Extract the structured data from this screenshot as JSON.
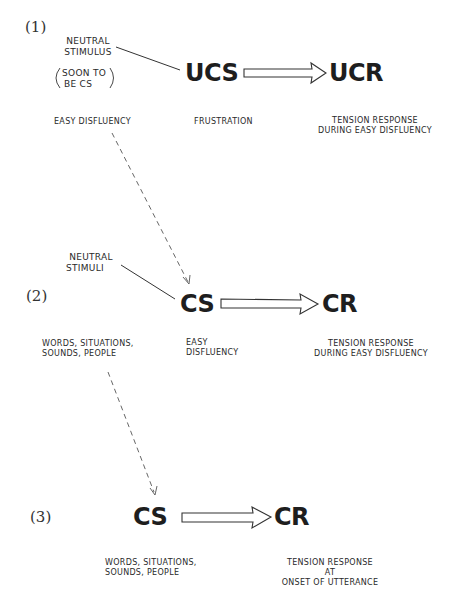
{
  "diagram": {
    "type": "classical-conditioning-stages",
    "stages": [
      {
        "number_label": "(1)",
        "stimulus_label": "UCS",
        "response_label": "UCR",
        "neutral_label_lines": [
          "NEUTRAL",
          "STIMULUS"
        ],
        "neutral_note_lines": [
          "SOON TO",
          "BE CS"
        ],
        "left_caption": "EASY DISFLUENCY",
        "stimulus_caption": "FRUSTRATION",
        "response_caption_lines": [
          "TENSION RESPONSE",
          "DURING EASY DISFLUENCY"
        ]
      },
      {
        "number_label": "(2)",
        "stimulus_label": "CS",
        "response_label": "CR",
        "neutral_label_lines": [
          "NEUTRAL",
          "STIMULI"
        ],
        "left_caption_lines": [
          "WORDS, SITUATIONS,",
          "SOUNDS, PEOPLE"
        ],
        "stimulus_caption_lines": [
          "EASY",
          "DISFLUENCY"
        ],
        "response_caption_lines": [
          "TENSION RESPONSE",
          "DURING EASY DISFLUENCY"
        ]
      },
      {
        "number_label": "(3)",
        "stimulus_label": "CS",
        "response_label": "CR",
        "stimulus_caption_lines": [
          "WORDS, SITUATIONS,",
          "SOUNDS, PEOPLE"
        ],
        "response_caption_lines": [
          "TENSION RESPONSE",
          "AT",
          "ONSET OF UTTERANCE"
        ]
      }
    ],
    "edges": [
      {
        "from": "stage1.neutral_stimulus",
        "to": "stage1.UCS",
        "style": "solid-line"
      },
      {
        "from": "stage1.UCS",
        "to": "stage1.UCR",
        "style": "hollow-arrow"
      },
      {
        "from": "stage1.easy_disfluency",
        "to": "stage2.CS",
        "style": "dashed-arrow"
      },
      {
        "from": "stage2.neutral_stimuli",
        "to": "stage2.CS",
        "style": "solid-line"
      },
      {
        "from": "stage2.CS",
        "to": "stage2.CR",
        "style": "hollow-arrow"
      },
      {
        "from": "stage2.words_situations",
        "to": "stage3.CS",
        "style": "dashed-arrow"
      },
      {
        "from": "stage3.CS",
        "to": "stage3.CR",
        "style": "hollow-arrow"
      }
    ]
  }
}
